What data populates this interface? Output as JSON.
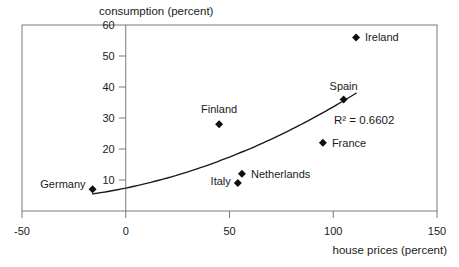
{
  "chart_data": {
    "type": "scatter",
    "title": "consumption (percent)",
    "xlabel": "house prices (percent)",
    "ylabel": "consumption (percent)",
    "xlim": [
      -50,
      150
    ],
    "ylim": [
      0,
      60
    ],
    "x_ticks": [
      -50,
      0,
      50,
      100,
      150
    ],
    "y_ticks": [
      10,
      20,
      30,
      40,
      50,
      60
    ],
    "grid": false,
    "legend": "none",
    "points": [
      {
        "label": "Germany",
        "x": -16,
        "y": 7,
        "label_side": "left",
        "label_dy": -5
      },
      {
        "label": "Finland",
        "x": 45,
        "y": 28,
        "label_side": "above",
        "label_dy": -2
      },
      {
        "label": "Italy",
        "x": 54,
        "y": 9,
        "label_side": "left",
        "label_dy": -2
      },
      {
        "label": "Netherlands",
        "x": 56,
        "y": 12,
        "label_side": "right",
        "label_dy": 0
      },
      {
        "label": "France",
        "x": 95,
        "y": 22,
        "label_side": "right",
        "label_dy": 0
      },
      {
        "label": "Spain",
        "x": 105,
        "y": 36,
        "label_side": "above",
        "label_dy": 0
      },
      {
        "label": "Ireland",
        "x": 111,
        "y": 56,
        "label_side": "right",
        "label_dy": 0
      }
    ],
    "trendline": {
      "fit": "quadratic",
      "coefficients": {
        "a": 7.4,
        "b": 0.138,
        "c": 0.00124
      },
      "x_start": -16,
      "x_end": 111,
      "r_squared": 0.6602,
      "r_squared_label": "R² = 0.6602"
    }
  },
  "colors": {
    "background": "#ffffff",
    "frame": "#7a7a7a",
    "tick": "#7a7a7a",
    "marker": "#101010",
    "trendline": "#1a1a1a",
    "text": "#1a1a1a"
  }
}
